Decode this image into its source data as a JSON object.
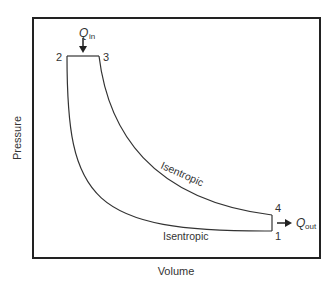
{
  "diagram": {
    "axes": {
      "xlabel": "Volume",
      "ylabel": "Pressure"
    },
    "points": [
      {
        "id": "1",
        "label": "1"
      },
      {
        "id": "2",
        "label": "2"
      },
      {
        "id": "3",
        "label": "3"
      },
      {
        "id": "4",
        "label": "4"
      }
    ],
    "processes": [
      {
        "from": "1",
        "to": "2",
        "type": "Isentropic",
        "label": "Isentropic"
      },
      {
        "from": "2",
        "to": "3",
        "type": "Isobaric"
      },
      {
        "from": "3",
        "to": "4",
        "type": "Isentropic",
        "label": "Isentropic"
      },
      {
        "from": "4",
        "to": "1",
        "type": "Isobaric"
      }
    ],
    "heat": {
      "in": {
        "symbol": "Q",
        "subscript": "in"
      },
      "out": {
        "symbol": "Q",
        "subscript": "out"
      }
    },
    "colors": {
      "line": "#333333",
      "frame": "#222222"
    }
  }
}
